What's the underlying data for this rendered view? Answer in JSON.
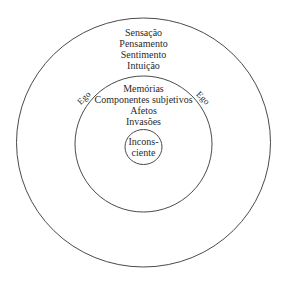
{
  "diagram": {
    "type": "concentric-circles",
    "outer_ring": {
      "items": [
        "Sensação",
        "Pensamento",
        "Sentimento",
        "Intuição"
      ]
    },
    "boundary_labels": {
      "left": "Ego",
      "right": "Ego"
    },
    "middle_ring": {
      "items": [
        "Memórias",
        "Componentes subjetivos",
        "Afetos",
        "Invasões"
      ]
    },
    "center": {
      "line1": "Incons-",
      "line2": "ciente"
    },
    "colors": {
      "stroke": "#4a4a4a",
      "text": "#2a2a2a",
      "background": "#ffffff"
    }
  }
}
